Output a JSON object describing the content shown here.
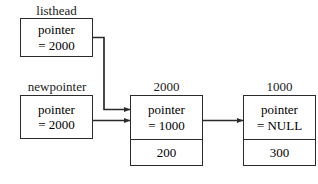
{
  "diagram": {
    "type": "linked-list",
    "stroke_color": "#2b2b2b",
    "text_color": "#1b1b1b",
    "background": "#ffffff",
    "pointer_vars": [
      {
        "id": "listhead",
        "caption": "listhead",
        "line1": "pointer",
        "line2": "= 2000"
      },
      {
        "id": "newpointer",
        "caption": "newpointer",
        "line1": "pointer",
        "line2": "= 2000"
      }
    ],
    "nodes": [
      {
        "id": "node-2000",
        "address": "2000",
        "pointer_line1": "pointer",
        "pointer_line2": "= 1000",
        "data": "200"
      },
      {
        "id": "node-1000",
        "address": "1000",
        "pointer_line1": "pointer",
        "pointer_line2": "= NULL",
        "data": "300"
      }
    ],
    "edges": [
      {
        "id": "edge-listhead-to-2000",
        "from": "listhead",
        "to": "node-2000",
        "style": "orthogonal"
      },
      {
        "id": "edge-newpointer-to-2000",
        "from": "newpointer",
        "to": "node-2000",
        "style": "straight"
      },
      {
        "id": "edge-2000-to-1000",
        "from": "node-2000",
        "to": "node-1000",
        "style": "straight"
      }
    ]
  }
}
